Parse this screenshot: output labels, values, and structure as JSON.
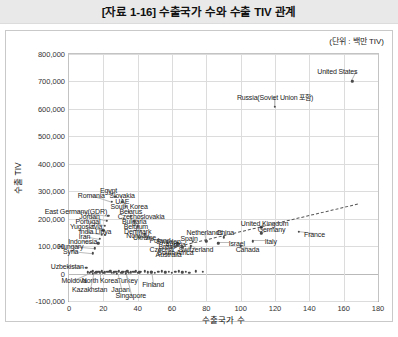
{
  "header": {
    "title": "[자료 1-16] 수출국가 수와 수출 TIV 관계"
  },
  "figure": {
    "unit_note": "(단위 : 백만 TIV)"
  },
  "chart_data": {
    "type": "scatter",
    "title": "[자료 1-16] 수출국가 수와 수출 TIV 관계",
    "xlabel": "수출국가 수",
    "ylabel": "수출 TIV",
    "unit_note": "(단위 : 백만 TIV)",
    "xlim": [
      0,
      180
    ],
    "ylim": [
      -100000,
      800000
    ],
    "xticks": [
      0,
      20,
      40,
      60,
      80,
      100,
      120,
      140,
      160,
      180
    ],
    "yticks": [
      -100000,
      0,
      100000,
      200000,
      300000,
      400000,
      500000,
      600000,
      700000,
      800000
    ],
    "ytick_labels": [
      "-100,000",
      "0",
      "100,000",
      "200,000",
      "300,000",
      "400,000",
      "500,000",
      "600,000",
      "700,000",
      "800,000"
    ],
    "xtick_labels": [
      "0",
      "20",
      "40",
      "60",
      "80",
      "100",
      "120",
      "140",
      "160",
      "180"
    ],
    "grid": true,
    "legend": false,
    "trendline": {
      "type": "linear-dashed",
      "x0": 56,
      "y0": 90000,
      "x1": 168,
      "y1": 255000
    },
    "points": [
      {
        "name": "United States",
        "x": 165,
        "y": 700000,
        "lx": 168,
        "ly": 737000,
        "anchor": "end"
      },
      {
        "name": "Russia(Soviet Union 포함)",
        "x": 120,
        "y": 608000,
        "lx": 120,
        "ly": 645000,
        "anchor": "middle"
      },
      {
        "name": "France",
        "x": 134,
        "y": 152000,
        "lx": 143,
        "ly": 145000,
        "anchor": "middle"
      },
      {
        "name": "United Kingdom",
        "x": 112,
        "y": 168000,
        "lx": 114,
        "ly": 186000,
        "anchor": "middle"
      },
      {
        "name": "Germany",
        "x": 112,
        "y": 146000,
        "lx": 118,
        "ly": 163000,
        "anchor": "middle"
      },
      {
        "name": "China",
        "x": 90,
        "y": 132000,
        "lx": 91,
        "ly": 152000,
        "anchor": "middle"
      },
      {
        "name": "Italy",
        "x": 107,
        "y": 117000,
        "lx": 114,
        "ly": 117000,
        "anchor": "start"
      },
      {
        "name": "Israel",
        "x": 87,
        "y": 110000,
        "lx": 93,
        "ly": 110000,
        "anchor": "start"
      },
      {
        "name": "Canada",
        "x": 100,
        "y": 100000,
        "lx": 104,
        "ly": 91000,
        "anchor": "middle"
      },
      {
        "name": "Netherlands",
        "x": 80,
        "y": 118000,
        "lx": 79,
        "ly": 153000,
        "anchor": "middle"
      },
      {
        "name": "Spain",
        "x": 72,
        "y": 115000,
        "lx": 70,
        "ly": 128000,
        "anchor": "middle"
      },
      {
        "name": "Switzerland",
        "x": 71,
        "y": 100000,
        "lx": 74,
        "ly": 88000,
        "anchor": "middle"
      },
      {
        "name": "Sweden",
        "x": 63,
        "y": 113000,
        "lx": 58,
        "ly": 117000,
        "anchor": "middle"
      },
      {
        "name": "Poland",
        "x": 60,
        "y": 116000,
        "lx": 53,
        "ly": 124000,
        "anchor": "middle"
      },
      {
        "name": "Austria",
        "x": 64,
        "y": 108000,
        "lx": 62,
        "ly": 107000,
        "anchor": "middle"
      },
      {
        "name": "Brazil",
        "x": 63,
        "y": 103000,
        "lx": 57,
        "ly": 100000,
        "anchor": "middle"
      },
      {
        "name": "Czechia",
        "x": 62,
        "y": 97000,
        "lx": 54,
        "ly": 88000,
        "anchor": "middle"
      },
      {
        "name": "South Africa",
        "x": 66,
        "y": 95000,
        "lx": 62,
        "ly": 80000,
        "anchor": "middle"
      },
      {
        "name": "Australia",
        "x": 60,
        "y": 93000,
        "lx": 58,
        "ly": 71000,
        "anchor": "middle"
      },
      {
        "name": "Ukraine",
        "x": 52,
        "y": 122000,
        "lx": 44,
        "ly": 132000,
        "anchor": "middle"
      },
      {
        "name": "Norway",
        "x": 47,
        "y": 130000,
        "lx": 40,
        "ly": 142000,
        "anchor": "middle"
      },
      {
        "name": "Denmark",
        "x": 44,
        "y": 143000,
        "lx": 40,
        "ly": 155000,
        "anchor": "middle"
      },
      {
        "name": "Belgium",
        "x": 42,
        "y": 155000,
        "lx": 39,
        "ly": 172000,
        "anchor": "middle"
      },
      {
        "name": "Bulgaria",
        "x": 40,
        "y": 172000,
        "lx": 38,
        "ly": 191000,
        "anchor": "middle"
      },
      {
        "name": "Czechoslovakia",
        "x": 38,
        "y": 190000,
        "lx": 42,
        "ly": 209000,
        "anchor": "middle"
      },
      {
        "name": "Belarus",
        "x": 36,
        "y": 208000,
        "lx": 36,
        "ly": 228000,
        "anchor": "middle"
      },
      {
        "name": "South Korea",
        "x": 35,
        "y": 226000,
        "lx": 35,
        "ly": 247000,
        "anchor": "middle"
      },
      {
        "name": "UAE",
        "x": 33,
        "y": 244000,
        "lx": 31,
        "ly": 266000,
        "anchor": "middle"
      },
      {
        "name": "Slovakia",
        "x": 31,
        "y": 262000,
        "lx": 31,
        "ly": 286000,
        "anchor": "middle"
      },
      {
        "name": "Egypt",
        "x": 27,
        "y": 280000,
        "lx": 23,
        "ly": 306000,
        "anchor": "middle"
      },
      {
        "name": "Romania",
        "x": 25,
        "y": 262000,
        "lx": 13,
        "ly": 286000,
        "anchor": "middle"
      },
      {
        "name": "East Germany(GDR)",
        "x": 23,
        "y": 210000,
        "lx": 4,
        "ly": 228000,
        "anchor": "middle"
      },
      {
        "name": "Jordan",
        "x": 22,
        "y": 192000,
        "lx": 12,
        "ly": 209000,
        "anchor": "middle"
      },
      {
        "name": "Portugal",
        "x": 21,
        "y": 175000,
        "lx": 11,
        "ly": 191000,
        "anchor": "middle"
      },
      {
        "name": "Yugoslavia",
        "x": 20,
        "y": 158000,
        "lx": 10,
        "ly": 173000,
        "anchor": "middle"
      },
      {
        "name": "India",
        "x": 19,
        "y": 142000,
        "lx": 10,
        "ly": 155000,
        "anchor": "middle"
      },
      {
        "name": "Libya",
        "x": 21,
        "y": 142000,
        "lx": 20,
        "ly": 155000,
        "anchor": "middle"
      },
      {
        "name": "Iran",
        "x": 18,
        "y": 126000,
        "lx": 9,
        "ly": 137000,
        "anchor": "middle"
      },
      {
        "name": "Indonesia",
        "x": 17,
        "y": 110000,
        "lx": 8,
        "ly": 120000,
        "anchor": "middle"
      },
      {
        "name": "Hungary",
        "x": 15,
        "y": 92000,
        "lx": 1,
        "ly": 100000,
        "anchor": "middle"
      },
      {
        "name": "Syria",
        "x": 14,
        "y": 74000,
        "lx": 1,
        "ly": 82000,
        "anchor": "middle"
      },
      {
        "name": "Uzbekistan",
        "x": 10,
        "y": 22000,
        "lx": -1,
        "ly": 27000,
        "anchor": "middle"
      },
      {
        "name": "Moldova",
        "x": 12,
        "y": 2000,
        "lx": 3,
        "ly": -23000,
        "anchor": "middle"
      },
      {
        "name": "North Korea",
        "x": 18,
        "y": 2000,
        "lx": 18,
        "ly": -23000,
        "anchor": "middle"
      },
      {
        "name": "Turkey",
        "x": 33,
        "y": 6000,
        "lx": 34,
        "ly": -23000,
        "anchor": "middle"
      },
      {
        "name": "Kazakhstan",
        "x": 14,
        "y": 0,
        "lx": 12,
        "ly": -55000,
        "anchor": "middle"
      },
      {
        "name": "Japan",
        "x": 28,
        "y": 0,
        "lx": 30,
        "ly": -55000,
        "anchor": "middle"
      },
      {
        "name": "Singapore",
        "x": 33,
        "y": -2000,
        "lx": 36,
        "ly": -78000,
        "anchor": "middle"
      },
      {
        "name": "Finland",
        "x": 48,
        "y": 4000,
        "lx": 49,
        "ly": -38000,
        "anchor": "middle"
      }
    ],
    "cluster_points_x": [
      11,
      13,
      14,
      15,
      16,
      17,
      18,
      19,
      20,
      21,
      22,
      23,
      24,
      25,
      26,
      27,
      28,
      29,
      30,
      31,
      32,
      33,
      34,
      35,
      36,
      37,
      38,
      39,
      40,
      41,
      42,
      44,
      46,
      48,
      50,
      52,
      54,
      56,
      58,
      60,
      62,
      64,
      66,
      68,
      70,
      74,
      78
    ]
  }
}
